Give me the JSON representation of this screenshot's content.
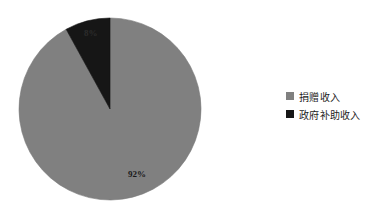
{
  "chart_data": {
    "type": "pie",
    "title": "",
    "subtitle": "",
    "xlabel": "",
    "ylabel": "",
    "grid": false,
    "legend_position": "right",
    "categories": [
      "捐赠收入",
      "政府补助收入"
    ],
    "values": [
      92,
      8
    ],
    "unit": "%",
    "slices": [
      {
        "label": "捐赠收入",
        "value": 92,
        "data_label": "92%",
        "color": "#808080",
        "start_angle_deg": 0,
        "sweep_deg": 331.2
      },
      {
        "label": "政府补助收入",
        "value": 8,
        "data_label": "8%",
        "color": "#161616",
        "start_angle_deg": 331.2,
        "sweep_deg": 28.8
      }
    ],
    "legend": [
      {
        "label": "捐赠收入",
        "color": "#808080"
      },
      {
        "label": "政府补助收入",
        "color": "#161616"
      }
    ]
  },
  "colors": {
    "background": "#ffffff",
    "donation_gray": "#808080",
    "subsidy_black": "#161616",
    "slice_outline": "#6e6e6e",
    "text": "#1c1c1c"
  },
  "geometry": {
    "center_x": 110,
    "center_y": 109,
    "radius": 91
  }
}
